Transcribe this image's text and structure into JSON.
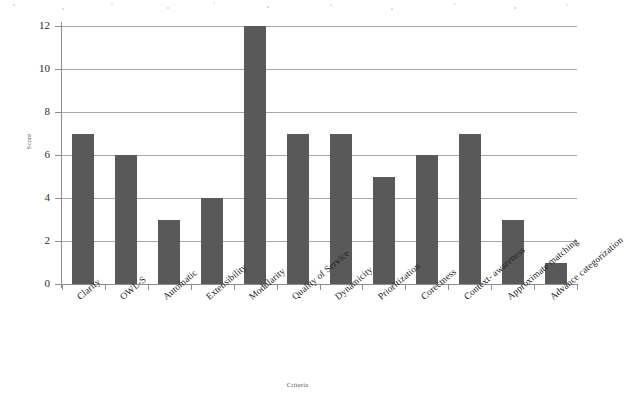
{
  "chart_data": {
    "type": "bar",
    "title": "",
    "xlabel": "Criteria",
    "ylabel": "Score",
    "categories": [
      "Clarity",
      "OWL-S",
      "Automatic",
      "Extensibility",
      "Modularity",
      "Quality of Service",
      "Dynamicity",
      "Prioritization",
      "Corectness",
      "Context- awareness",
      "Approximate matching",
      "Advance categorization"
    ],
    "values": [
      7,
      6,
      3,
      4,
      12,
      7,
      7,
      5,
      6,
      7,
      3,
      1
    ],
    "ylim": [
      0,
      12
    ],
    "yticks": [
      0,
      2,
      4,
      6,
      8,
      10,
      12
    ],
    "ytick_labels": [
      "0",
      "2",
      "4",
      "6",
      "8",
      "10",
      "12"
    ],
    "grid": true,
    "legend": "none",
    "bar_color": "#595959",
    "gridline_color": "#a8a8a8",
    "axis_color": "#8e8e8e",
    "background_color": "#ffffff"
  }
}
